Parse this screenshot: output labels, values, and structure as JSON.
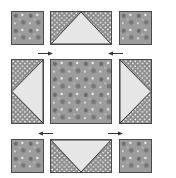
{
  "diagram": {
    "layout": "3x3 grid",
    "colors": {
      "main_fabric": "#9c9c9c",
      "main_fabric_flower": "#6e6e6e",
      "main_fabric_dot": "#f2f2f2",
      "dotted_fabric": "#8a8a8a",
      "dotted_fabric_dot": "#ffffff",
      "goose_triangle": "#e6e6e6",
      "outline": "#333333",
      "arrow": "#333333"
    },
    "pieces": [
      {
        "id": "top-left",
        "type": "square",
        "fabric": "main"
      },
      {
        "id": "top-center",
        "type": "flying-geese",
        "point": "up"
      },
      {
        "id": "top-right",
        "type": "square",
        "fabric": "main"
      },
      {
        "id": "middle-left",
        "type": "flying-geese",
        "point": "left"
      },
      {
        "id": "center",
        "type": "large-square",
        "fabric": "main"
      },
      {
        "id": "middle-right",
        "type": "flying-geese",
        "point": "right"
      },
      {
        "id": "bottom-left",
        "type": "square",
        "fabric": "main"
      },
      {
        "id": "bottom-center",
        "type": "flying-geese",
        "point": "down"
      },
      {
        "id": "bottom-right",
        "type": "square",
        "fabric": "main"
      }
    ],
    "arrows": [
      {
        "id": "top-left-arrow",
        "direction": "right"
      },
      {
        "id": "top-right-arrow",
        "direction": "left"
      },
      {
        "id": "bottom-left-arrow",
        "direction": "left"
      },
      {
        "id": "bottom-right-arrow",
        "direction": "right"
      }
    ]
  }
}
